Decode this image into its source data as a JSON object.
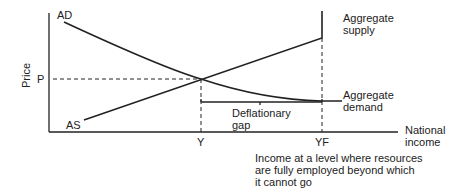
{
  "diagram": {
    "axes": {
      "y_label": "Price",
      "x_label_line1": "National",
      "x_label_line2": "income",
      "y_tick": "P",
      "x_ticks": [
        "Y",
        "YF"
      ]
    },
    "curves": {
      "ad_short": "AD",
      "as_short": "AS",
      "as_long_line1": "Aggregate",
      "as_long_line2": "supply",
      "ad_long_line1": "Aggregate",
      "ad_long_line2": "demand"
    },
    "gap": {
      "line1": "Deflationary",
      "line2": "gap"
    },
    "note": {
      "line1": "Income at a level where resources",
      "line2": "are fully employed beyond which",
      "line3": "it cannot go"
    },
    "colors": {
      "line": "#222222",
      "background": "#ffffff"
    }
  }
}
